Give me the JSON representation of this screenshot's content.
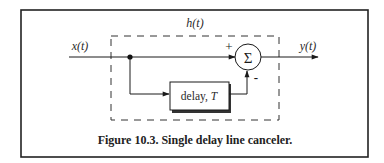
{
  "diagram": {
    "container_label": "h(t)",
    "input_label": "x(t)",
    "output_label": "y(t)",
    "summer_symbol": "Σ",
    "plus_sign": "+",
    "minus_sign": "-",
    "delay_block": {
      "label_prefix": "delay, ",
      "label_var": "T"
    },
    "caption": "Figure 10.3. Single delay line canceler.",
    "colors": {
      "stroke": "#1a1a1a",
      "text": "#2a2a2a",
      "background": "#ffffff",
      "shadow": "#333333"
    }
  }
}
